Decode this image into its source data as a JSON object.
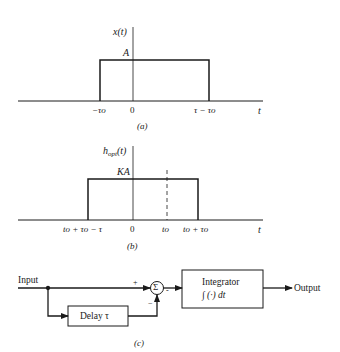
{
  "panel_a": {
    "y_axis_label": "x(t)",
    "level_label": "A",
    "x_axis_label": "t",
    "ticks": [
      "−τo",
      "0",
      "τ − τo"
    ],
    "caption": "(a)"
  },
  "panel_b": {
    "y_axis_label_main": "h",
    "y_axis_label_sub": "opt",
    "y_axis_label_arg": "(t)",
    "level_label": "KA",
    "x_axis_label": "t",
    "ticks": [
      "to + τo − τ",
      "0",
      "to",
      "to + τo"
    ],
    "caption": "(b)"
  },
  "panel_c": {
    "input_label": "Input",
    "plus_sign": "+",
    "minus_sign_bottom": "−",
    "minus_sign_right": "-",
    "summer_symbol": "Σ",
    "delay_label": "Delay τ",
    "integrator_title": "Integrator",
    "integrator_formula": "∫ (·) dt",
    "output_label": "Output",
    "caption": "(c)"
  },
  "colors": {
    "ink": "#1a1a1a",
    "background": "#ffffff"
  }
}
